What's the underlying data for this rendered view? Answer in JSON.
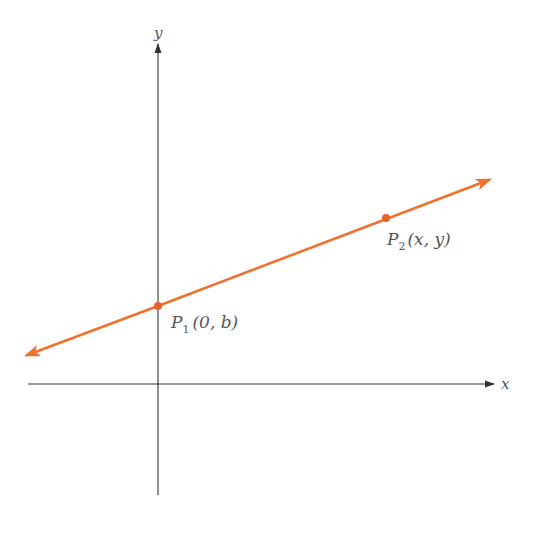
{
  "diagram": {
    "axes": {
      "x_label": "x",
      "y_label": "y"
    },
    "points": [
      {
        "name": "P",
        "subscript": "1",
        "coords": "(0, b)"
      },
      {
        "name": "P",
        "subscript": "2",
        "coords": "(x, y)"
      }
    ],
    "colors": {
      "line": "#f07030",
      "axis": "#333333",
      "text": "#555555"
    }
  }
}
